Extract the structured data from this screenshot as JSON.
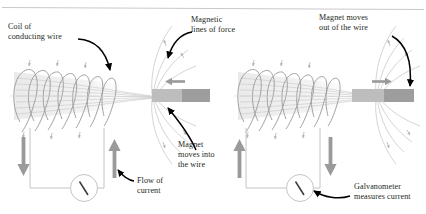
{
  "figure": {
    "background": "#ffffff",
    "rule_color": "#c9c9c9",
    "text_color": "#231f20",
    "coil_wire_color": "#9b9b9b",
    "field_line_color": "#c2c2c2",
    "arrow_gray": "#9a9a9a",
    "magnet_light": "#b8b8b8",
    "magnet_dark": "#9d9d9d",
    "circuit_wire_color": "#bdbdbd",
    "callout_color": "#000000"
  },
  "labels": {
    "coil": "Coil of\nconducting wire",
    "field_lines": "Magnetic\nlines of force",
    "magnet_out": "Magnet moves\nout of the wire",
    "magnet_in": "Magnet\nmoves into\nthe wire",
    "current": "Flow of\ncurrent",
    "galvanometer": "Galvanometer\nmeasures current"
  },
  "panels": [
    {
      "id": "left-panel",
      "name": "magnet-entering-coil",
      "magnet_direction": "left",
      "magnet_motion": "into the wire",
      "current_left_arrow": "down",
      "current_right_arrow": "up",
      "coil_turns": 7,
      "galvanometer_needle": "deflected"
    },
    {
      "id": "right-panel",
      "name": "magnet-leaving-coil",
      "magnet_direction": "right",
      "magnet_motion": "out of the wire",
      "current_left_arrow": "up",
      "current_right_arrow": "down",
      "coil_turns": 7,
      "galvanometer_needle": "deflected"
    }
  ],
  "icons": {
    "magnet": "bar-magnet-icon",
    "galvanometer": "galvanometer-icon",
    "current_arrow": "current-arrow-icon",
    "motion_arrow": "motion-arrow-icon",
    "callout_arrow": "callout-arrow-icon"
  }
}
